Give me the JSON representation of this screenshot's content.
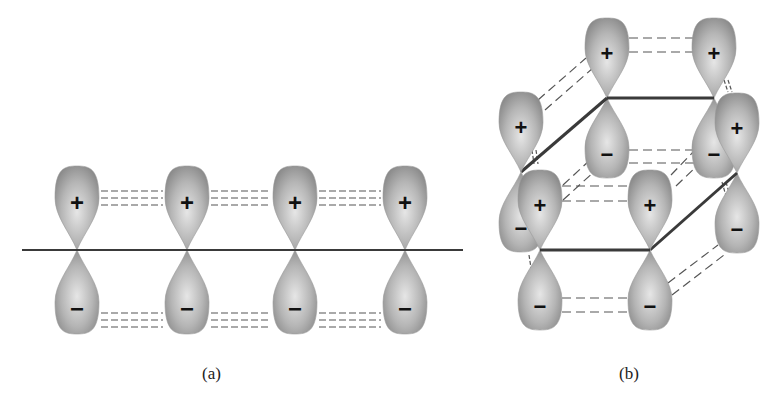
{
  "colors": {
    "lobe_light": "#d9d9d9",
    "lobe_dark": "#8c8c8c",
    "axis_line": "#3a3a3a",
    "dash_line": "#555555",
    "sign": "#111111"
  },
  "panel_a": {
    "caption": "(a)",
    "axis": {
      "x1": 22,
      "y1": 250,
      "x2": 463,
      "y2": 250
    },
    "orbitals": [
      {
        "x": 77,
        "y": 250,
        "top_sign": "+",
        "bottom_sign": "−"
      },
      {
        "x": 187,
        "y": 250,
        "top_sign": "+",
        "bottom_sign": "−"
      },
      {
        "x": 295,
        "y": 250,
        "top_sign": "+",
        "bottom_sign": "−"
      },
      {
        "x": 405,
        "y": 250,
        "top_sign": "+",
        "bottom_sign": "−"
      }
    ]
  },
  "panel_b": {
    "caption": "(b)",
    "ring_vertices": [
      {
        "name": "back-left",
        "x": 607,
        "y": 98,
        "top_sign": "+",
        "bottom_sign": "−"
      },
      {
        "name": "back-right",
        "x": 714,
        "y": 98,
        "top_sign": "+",
        "bottom_sign": "−"
      },
      {
        "name": "right",
        "x": 737,
        "y": 173,
        "top_sign": "+",
        "bottom_sign": "−"
      },
      {
        "name": "front-right",
        "x": 650,
        "y": 250,
        "top_sign": "+",
        "bottom_sign": "−"
      },
      {
        "name": "front-left",
        "x": 540,
        "y": 250,
        "top_sign": "+",
        "bottom_sign": "−"
      },
      {
        "name": "left",
        "x": 521,
        "y": 172,
        "top_sign": "+",
        "bottom_sign": "−"
      }
    ]
  }
}
